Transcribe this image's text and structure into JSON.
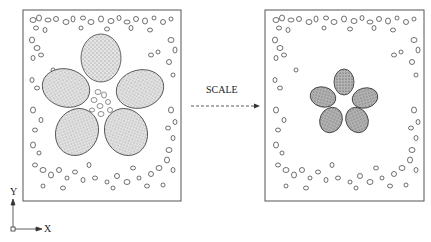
{
  "diagram": {
    "transform_label": "SCALE",
    "axis": {
      "x_label": "X",
      "y_label": "Y"
    },
    "panels": [
      {
        "name": "before",
        "description": "Five-petal flower with large petals surrounded by scattered pebbles"
      },
      {
        "name": "after",
        "description": "Same scene with flower scaled down; pebbles unchanged"
      }
    ],
    "colors": {
      "stroke": "#333333",
      "petal_fill": "#c8c8c8",
      "petal_fill_scaled": "#9a9a9a",
      "background": "#ffffff"
    }
  }
}
